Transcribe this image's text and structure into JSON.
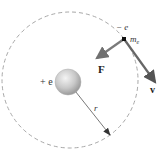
{
  "diagram": {
    "nucleus": {
      "label": "+ e",
      "center": [
        68,
        82
      ],
      "radius": 13
    },
    "orbit": {
      "center": [
        70,
        80
      ],
      "radius": 68,
      "style": "dashed",
      "color": "#a0a0a0"
    },
    "electron": {
      "charge_label": "− e",
      "mass_label_main": "m",
      "mass_label_sub": "e",
      "position": [
        124,
        39
      ]
    },
    "force_vector": {
      "label": "F",
      "from": [
        124,
        39
      ],
      "to": [
        95,
        59
      ],
      "color": "#707070"
    },
    "velocity_vector": {
      "label": "v",
      "from": [
        124,
        39
      ],
      "to": [
        157,
        84
      ],
      "color": "#606060"
    },
    "radius_line": {
      "label": "r",
      "from": [
        68,
        82
      ],
      "to": [
        110,
        135
      ],
      "color": "#555555"
    }
  }
}
